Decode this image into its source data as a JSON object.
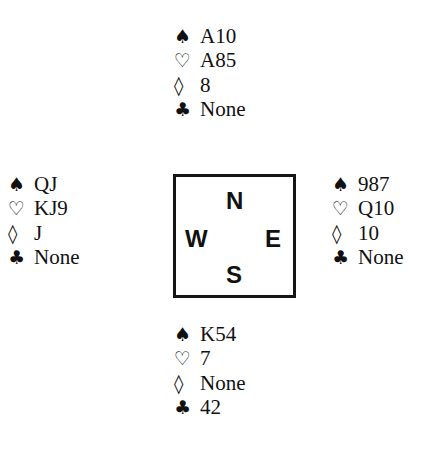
{
  "suits": {
    "spades": "♠",
    "hearts": "♡",
    "diamonds": "◊",
    "clubs": "♣"
  },
  "compass": {
    "north": "N",
    "west": "W",
    "east": "E",
    "south": "S"
  },
  "hands": {
    "north": {
      "spades": "A10",
      "hearts": "A85",
      "diamonds": "8",
      "clubs": "None"
    },
    "west": {
      "spades": "QJ",
      "hearts": "KJ9",
      "diamonds": "J",
      "clubs": "None"
    },
    "east": {
      "spades": "987",
      "hearts": "Q10",
      "diamonds": "10",
      "clubs": "None"
    },
    "south": {
      "spades": "K54",
      "hearts": "7",
      "diamonds": "None",
      "clubs": "42"
    }
  }
}
